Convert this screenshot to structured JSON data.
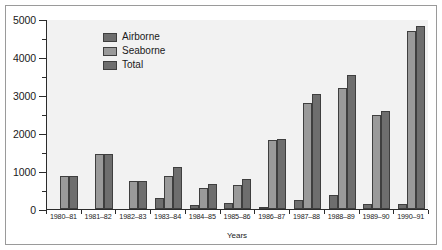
{
  "chart_data": {
    "type": "bar",
    "title": "",
    "subtitle": "",
    "xlabel": "Years",
    "ylabel": "",
    "ylim": [
      0,
      5000
    ],
    "yticks": [
      0,
      1000,
      2000,
      3000,
      4000,
      5000
    ],
    "yminorticks": [
      500,
      1500,
      2500,
      3500,
      4500
    ],
    "ytick_labels": [
      "0",
      "1000",
      "2000",
      "3000",
      "4000",
      "5000"
    ],
    "grid": false,
    "legend_position": "upper-left-inside",
    "categories": [
      "1980–81",
      "1981–82",
      "1982–83",
      "1983–84",
      "1984–85",
      "1985–86",
      "1986–87",
      "1987–88",
      "1988–89",
      "1989–90",
      "1990–91"
    ],
    "series": [
      {
        "name": "Airborne",
        "color": "#6e6e6e",
        "values": [
          0,
          0,
          0,
          280,
          110,
          160,
          40,
          250,
          380,
          120,
          130
        ]
      },
      {
        "name": "Seaborne",
        "color": "#9a9a9a",
        "values": [
          860,
          1460,
          730,
          860,
          540,
          630,
          1805,
          2780,
          3180,
          2480,
          4690
        ]
      },
      {
        "name": "Total",
        "color": "#6e6e6e",
        "values": [
          860,
          1460,
          730,
          1110,
          660,
          790,
          1830,
          3030,
          3520,
          2580,
          4820
        ]
      }
    ]
  },
  "legend": {
    "items": [
      {
        "label": "Airborne",
        "swatch": "airborne"
      },
      {
        "label": "Seaborne",
        "swatch": "seaborne"
      },
      {
        "label": "Total",
        "swatch": "total"
      }
    ]
  },
  "axis": {
    "x_title": "Years"
  },
  "colors": {
    "plot_background": "#f2f2f2",
    "figure_background": "#ffffff",
    "axis_line": "#2b2b2b",
    "frame": "#9a9a9a",
    "bar_airborne": "#6e6e6e",
    "bar_seaborne": "#9a9a9a",
    "bar_total": "#6e6e6e",
    "bar_outline": "#3f3f3f",
    "text": "#1a1a1a"
  }
}
